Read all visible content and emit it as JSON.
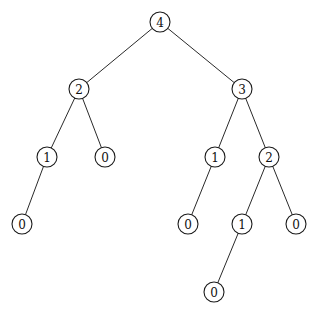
{
  "diagram": {
    "type": "binary-tree",
    "node_radius": 10,
    "colors": {
      "stroke": "#1a1a1a",
      "fill": "#ffffff",
      "text": "#111111"
    },
    "nodes": [
      {
        "id": "n0",
        "label": "4",
        "x": 160,
        "y": 22
      },
      {
        "id": "n1",
        "label": "2",
        "x": 79,
        "y": 89
      },
      {
        "id": "n2",
        "label": "3",
        "x": 242,
        "y": 89
      },
      {
        "id": "n3",
        "label": "1",
        "x": 47,
        "y": 157
      },
      {
        "id": "n4",
        "label": "0",
        "x": 105,
        "y": 157
      },
      {
        "id": "n5",
        "label": "1",
        "x": 215,
        "y": 157
      },
      {
        "id": "n6",
        "label": "2",
        "x": 269,
        "y": 157
      },
      {
        "id": "n7",
        "label": "0",
        "x": 22,
        "y": 224
      },
      {
        "id": "n8",
        "label": "0",
        "x": 188,
        "y": 224
      },
      {
        "id": "n9",
        "label": "1",
        "x": 242,
        "y": 224
      },
      {
        "id": "n10",
        "label": "0",
        "x": 296,
        "y": 224
      },
      {
        "id": "n11",
        "label": "0",
        "x": 214,
        "y": 292
      }
    ],
    "edges": [
      {
        "from": "n0",
        "to": "n1"
      },
      {
        "from": "n0",
        "to": "n2"
      },
      {
        "from": "n1",
        "to": "n3"
      },
      {
        "from": "n1",
        "to": "n4"
      },
      {
        "from": "n2",
        "to": "n5"
      },
      {
        "from": "n2",
        "to": "n6"
      },
      {
        "from": "n3",
        "to": "n7"
      },
      {
        "from": "n5",
        "to": "n8"
      },
      {
        "from": "n6",
        "to": "n9"
      },
      {
        "from": "n6",
        "to": "n10"
      },
      {
        "from": "n9",
        "to": "n11"
      }
    ]
  }
}
